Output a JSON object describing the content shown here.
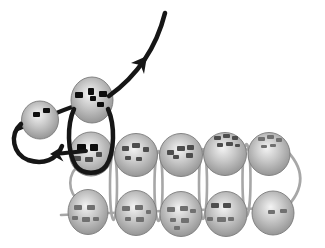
{
  "diagram": {
    "canvas": {
      "width": 325,
      "height": 248,
      "background": "#ffffff"
    },
    "colors": {
      "bead_highlight": "#f3f3f3",
      "bead_mid": "#c7c7c7",
      "bead_edge": "#8d8d8d",
      "bead_outline": "#7b7b7b",
      "thread_gray": "#a7a7a7",
      "thread_black": "#161616",
      "speckle_black": "#0d0d0d",
      "speckle_dark": "#4d4d4d",
      "speckle_gray": "#707070"
    },
    "beads": [
      {
        "name": "bead-new",
        "cx": 40,
        "cy": 120,
        "rx": 18.5,
        "ry": 19,
        "speckles": [
          [
            33,
            112,
            7,
            5,
            "black"
          ],
          [
            43,
            108,
            7,
            5,
            "black"
          ]
        ]
      },
      {
        "name": "bead-top",
        "cx": 92,
        "cy": 100,
        "rx": 21,
        "ry": 23,
        "speckles": [
          [
            75,
            92,
            8,
            6,
            "black"
          ],
          [
            88,
            88,
            6,
            7,
            "black"
          ],
          [
            90,
            96,
            6,
            5,
            "black"
          ],
          [
            99,
            91,
            8,
            6,
            "black"
          ],
          [
            97,
            102,
            7,
            5,
            "black"
          ]
        ]
      },
      {
        "name": "bead-row1-col1",
        "cx": 91,
        "cy": 154,
        "rx": 21.5,
        "ry": 22,
        "speckles": [
          [
            77,
            144,
            9,
            7,
            "black"
          ],
          [
            90,
            144,
            8,
            7,
            "black"
          ],
          [
            73,
            156,
            8,
            5,
            "dark"
          ],
          [
            85,
            157,
            8,
            5,
            "dark"
          ],
          [
            96,
            152,
            6,
            5,
            "dark"
          ]
        ]
      },
      {
        "name": "bead-row1-col2",
        "cx": 136,
        "cy": 155,
        "rx": 21.5,
        "ry": 21.5,
        "speckles": [
          [
            122,
            146,
            7,
            5,
            "dark"
          ],
          [
            132,
            143,
            8,
            5,
            "dark"
          ],
          [
            143,
            147,
            6,
            5,
            "dark"
          ],
          [
            125,
            156,
            6,
            4,
            "dark"
          ],
          [
            136,
            157,
            6,
            4,
            "dark"
          ]
        ]
      },
      {
        "name": "bead-row1-col3",
        "cx": 181,
        "cy": 155,
        "rx": 21.5,
        "ry": 21.5,
        "speckles": [
          [
            167,
            150,
            7,
            5,
            "dark"
          ],
          [
            177,
            146,
            8,
            5,
            "dark"
          ],
          [
            187,
            145,
            7,
            5,
            "dark"
          ],
          [
            173,
            155,
            6,
            4,
            "dark"
          ],
          [
            186,
            153,
            7,
            5,
            "dark"
          ]
        ]
      },
      {
        "name": "bead-row1-col4",
        "cx": 225,
        "cy": 154,
        "rx": 21.5,
        "ry": 21.5,
        "speckles": [
          [
            214,
            136,
            7,
            4,
            "dark"
          ],
          [
            223,
            134,
            7,
            4,
            "dark"
          ],
          [
            232,
            136,
            6,
            4,
            "dark"
          ],
          [
            217,
            143,
            6,
            4,
            "dark"
          ],
          [
            226,
            142,
            7,
            4,
            "dark"
          ],
          [
            235,
            144,
            5,
            3,
            "dark"
          ]
        ]
      },
      {
        "name": "bead-row1-col5",
        "cx": 269,
        "cy": 154,
        "rx": 21,
        "ry": 21.5,
        "speckles": [
          [
            258,
            137,
            7,
            4,
            "gray"
          ],
          [
            267,
            135,
            7,
            4,
            "gray"
          ],
          [
            276,
            138,
            6,
            4,
            "gray"
          ],
          [
            261,
            145,
            6,
            3,
            "gray"
          ],
          [
            270,
            144,
            6,
            3,
            "gray"
          ]
        ]
      },
      {
        "name": "bead-row2-col1",
        "cx": 88,
        "cy": 212,
        "rx": 20,
        "ry": 22.5,
        "speckles": [
          [
            74,
            205,
            8,
            5,
            "gray"
          ],
          [
            87,
            205,
            8,
            5,
            "gray"
          ],
          [
            72,
            216,
            6,
            4,
            "gray"
          ],
          [
            82,
            217,
            8,
            5,
            "gray"
          ],
          [
            93,
            217,
            6,
            4,
            "gray"
          ]
        ]
      },
      {
        "name": "bead-row2-col2",
        "cx": 136,
        "cy": 213,
        "rx": 20.5,
        "ry": 22.5,
        "speckles": [
          [
            122,
            206,
            8,
            5,
            "gray"
          ],
          [
            135,
            205,
            8,
            5,
            "gray"
          ],
          [
            125,
            217,
            6,
            4,
            "gray"
          ],
          [
            136,
            217,
            8,
            5,
            "gray"
          ],
          [
            146,
            210,
            5,
            4,
            "gray"
          ]
        ]
      },
      {
        "name": "bead-row2-col3",
        "cx": 181,
        "cy": 214,
        "rx": 21,
        "ry": 22.5,
        "speckles": [
          [
            167,
            207,
            8,
            5,
            "gray"
          ],
          [
            180,
            206,
            8,
            5,
            "gray"
          ],
          [
            190,
            209,
            6,
            4,
            "gray"
          ],
          [
            170,
            218,
            6,
            4,
            "gray"
          ],
          [
            181,
            218,
            8,
            5,
            "gray"
          ],
          [
            174,
            226,
            6,
            4,
            "gray"
          ]
        ]
      },
      {
        "name": "bead-row2-col4",
        "cx": 226,
        "cy": 214,
        "rx": 21,
        "ry": 22.5,
        "speckles": [
          [
            211,
            203,
            8,
            5,
            "dark"
          ],
          [
            223,
            203,
            8,
            5,
            "dark"
          ],
          [
            207,
            217,
            6,
            4,
            "gray"
          ],
          [
            217,
            217,
            9,
            5,
            "gray"
          ],
          [
            228,
            217,
            6,
            4,
            "gray"
          ]
        ]
      },
      {
        "name": "bead-row2-col5",
        "cx": 273,
        "cy": 213,
        "rx": 21,
        "ry": 22,
        "speckles": [
          [
            268,
            210,
            7,
            4,
            "gray"
          ],
          [
            280,
            209,
            7,
            4,
            "gray"
          ]
        ]
      }
    ],
    "threads_under": [
      {
        "name": "thread-row1-horizontal",
        "d": "M 70 156 C 140 153, 210 149, 284 149",
        "color": "gray",
        "width": 2.6
      },
      {
        "name": "thread-row2-horizontal",
        "d": "M 61 215 C 130 212, 210 209, 291 208",
        "color": "gray",
        "width": 2.6
      },
      {
        "name": "thread-left-end-loop",
        "d": "M 80 166 C 67 171, 67 195, 80 200",
        "color": "gray",
        "width": 2.6
      },
      {
        "name": "thread-right-end-loop",
        "d": "M 283 147 Q 317 178, 284 210",
        "color": "gray",
        "width": 2.8
      },
      {
        "name": "thread-black-through-new-beads",
        "d": "M 18 129 C 45 117, 75 105, 112 93",
        "color": "black",
        "width": 4
      }
    ],
    "gap_loops": [
      {
        "name": "thread-gap-loop-1",
        "cx": 113.5,
        "cy": 186,
        "rx": 3.5,
        "ry": 34
      },
      {
        "name": "thread-gap-loop-2",
        "cx": 158.5,
        "cy": 186,
        "rx": 4,
        "ry": 35
      },
      {
        "name": "thread-gap-loop-3",
        "cx": 203,
        "cy": 184,
        "rx": 4,
        "ry": 35
      },
      {
        "name": "thread-gap-loop-4",
        "cx": 246.5,
        "cy": 180,
        "rx": 4,
        "ry": 36
      }
    ],
    "threads_over": [
      {
        "name": "thread-black-circle-loop",
        "d": "M 74 109 C 67 125, 67 152, 76 166 C 83 175, 99 175, 106 166 C 115 152, 115 125, 108 109",
        "color": "black",
        "width": 4.5
      },
      {
        "name": "thread-black-hook-loop",
        "d": "M 21 124 C 9 135, 13 154, 28 160 C 43 165, 57 160, 62 146",
        "color": "black",
        "width": 4.5
      },
      {
        "name": "thread-left-arrow-shaft",
        "d": "M 86 151 C 76 152, 68 153, 59 153.5",
        "color": "black",
        "width": 4
      },
      {
        "name": "thread-exit-arrow-curve",
        "d": "M 109 96 Q 152 65, 165 13",
        "color": "black",
        "width": 4.6
      }
    ],
    "arrowheads": [
      {
        "name": "arrowhead-exit-direction",
        "points": "147,56 144,74 140.5,65 131,63",
        "color": "black"
      },
      {
        "name": "arrowhead-left-direction",
        "points": "50,154 63.5,161.5 59,153.8 63,146",
        "color": "black"
      }
    ]
  }
}
